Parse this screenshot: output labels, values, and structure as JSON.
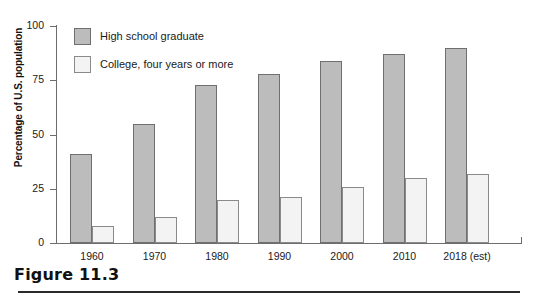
{
  "caption": {
    "label": "Figure 11.3"
  },
  "chart_data": {
    "type": "bar",
    "title": "",
    "xlabel": "",
    "ylabel": "Percentage of U.S. population",
    "ylim": [
      0,
      100
    ],
    "yticks": [
      0,
      25,
      50,
      75,
      100
    ],
    "ytick_labels": [
      "0",
      "25",
      "50",
      "75",
      "100"
    ],
    "grid": false,
    "legend_position": "top-left",
    "categories": [
      "1960",
      "1970",
      "1980",
      "1990",
      "2000",
      "2010",
      "2018 (est)"
    ],
    "series": [
      {
        "name": "High school graduate",
        "color": "#bcbcbc",
        "values": [
          41,
          55,
          73,
          78,
          84,
          87,
          90
        ]
      },
      {
        "name": "College, four years or more",
        "color": "#f3f3f3",
        "values": [
          8,
          12,
          20,
          21,
          26,
          30,
          32
        ]
      }
    ]
  }
}
